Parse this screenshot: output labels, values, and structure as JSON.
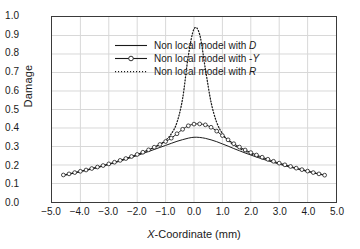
{
  "chart_data": {
    "type": "line",
    "title": "",
    "xlabel": "X-Coordinate (mm)",
    "ylabel": "Damage",
    "xlim": [
      -5.0,
      5.0
    ],
    "ylim": [
      0.0,
      1.0
    ],
    "grid": true,
    "legend_position": "upper-left-inside",
    "xticks": [
      "-5.0",
      "-4.0",
      "-3.0",
      "-2.0",
      "-1.0",
      "0.0",
      "1.0",
      "2.0",
      "3.0",
      "4.0",
      "5.0"
    ],
    "xtick_values": [
      -5.0,
      -4.0,
      -3.0,
      -2.0,
      -1.0,
      0.0,
      1.0,
      2.0,
      3.0,
      4.0,
      5.0
    ],
    "yticks": [
      "0.0",
      "0.1",
      "0.2",
      "0.3",
      "0.4",
      "0.5",
      "0.6",
      "0.7",
      "0.8",
      "0.9",
      "1.0"
    ],
    "ytick_values": [
      0.0,
      0.1,
      0.2,
      0.3,
      0.4,
      0.5,
      0.6,
      0.7,
      0.8,
      0.9,
      1.0
    ],
    "x": [
      -4.6,
      -4.4,
      -4.2,
      -4.0,
      -3.8,
      -3.6,
      -3.4,
      -3.2,
      -3.0,
      -2.8,
      -2.6,
      -2.4,
      -2.2,
      -2.0,
      -1.8,
      -1.6,
      -1.4,
      -1.2,
      -1.0,
      -0.8,
      -0.6,
      -0.4,
      -0.2,
      0.0,
      0.2,
      0.4,
      0.6,
      0.8,
      1.0,
      1.2,
      1.4,
      1.6,
      1.8,
      2.0,
      2.2,
      2.4,
      2.6,
      2.8,
      3.0,
      3.2,
      3.4,
      3.6,
      3.8,
      4.0,
      4.2,
      4.4,
      4.6
    ],
    "series": [
      {
        "name": "Non local model with D",
        "style": "solid",
        "marker": "none",
        "color": "#1a1a1a",
        "peak": 0.35,
        "values": [
          0.144,
          0.15,
          0.157,
          0.164,
          0.171,
          0.178,
          0.186,
          0.194,
          0.203,
          0.212,
          0.221,
          0.231,
          0.241,
          0.251,
          0.262,
          0.273,
          0.284,
          0.295,
          0.306,
          0.317,
          0.328,
          0.337,
          0.345,
          0.35,
          0.349,
          0.344,
          0.336,
          0.326,
          0.314,
          0.302,
          0.289,
          0.277,
          0.265,
          0.254,
          0.243,
          0.233,
          0.223,
          0.214,
          0.205,
          0.196,
          0.188,
          0.18,
          0.172,
          0.165,
          0.158,
          0.151,
          0.144
        ]
      },
      {
        "name": "Non local model with -Y",
        "style": "solid",
        "marker": "open-circle",
        "color": "#1a1a1a",
        "peak": 0.42,
        "values": [
          0.146,
          0.152,
          0.159,
          0.166,
          0.173,
          0.181,
          0.189,
          0.197,
          0.206,
          0.215,
          0.225,
          0.235,
          0.246,
          0.257,
          0.269,
          0.282,
          0.296,
          0.311,
          0.327,
          0.345,
          0.369,
          0.393,
          0.412,
          0.421,
          0.422,
          0.417,
          0.404,
          0.383,
          0.359,
          0.336,
          0.315,
          0.297,
          0.281,
          0.267,
          0.254,
          0.242,
          0.231,
          0.22,
          0.21,
          0.201,
          0.192,
          0.183,
          0.175,
          0.167,
          0.159,
          0.152,
          0.145
        ]
      },
      {
        "name": "Non local model with R",
        "style": "dotted",
        "marker": "none",
        "color": "#1a1a1a",
        "peak": 0.94,
        "values": [
          0.145,
          0.151,
          0.158,
          0.165,
          0.172,
          0.18,
          0.188,
          0.196,
          0.205,
          0.214,
          0.224,
          0.234,
          0.245,
          0.256,
          0.268,
          0.281,
          0.295,
          0.312,
          0.333,
          0.368,
          0.43,
          0.56,
          0.79,
          0.935,
          0.905,
          0.72,
          0.54,
          0.43,
          0.37,
          0.333,
          0.308,
          0.29,
          0.275,
          0.262,
          0.25,
          0.239,
          0.228,
          0.218,
          0.209,
          0.2,
          0.191,
          0.183,
          0.175,
          0.167,
          0.159,
          0.152,
          0.145
        ]
      }
    ]
  },
  "legend": {
    "items": [
      {
        "label_pre": "Non local model with ",
        "label_it": "D",
        "label_post": ""
      },
      {
        "label_pre": "Non local model with -",
        "label_it": "Y",
        "label_post": ""
      },
      {
        "label_pre": "Non local model with ",
        "label_it": "R",
        "label_post": ""
      }
    ]
  },
  "axes": {
    "x_title_pre": "",
    "x_title_it": "X",
    "x_title_post": "-Coordinate (mm)",
    "y_title": "Damage"
  },
  "colors": {
    "line": "#1a1a1a",
    "grid": "#d8d8d8",
    "frame": "#3a3a3a",
    "background": "#ffffff"
  }
}
